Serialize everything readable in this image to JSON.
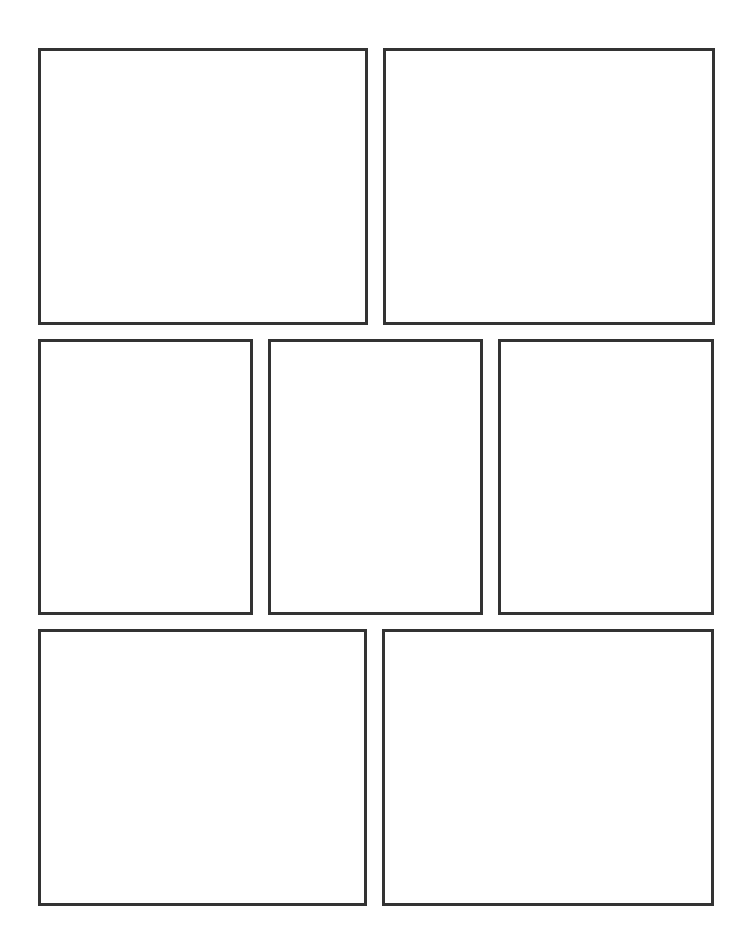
{
  "page": {
    "type": "comic-page-template",
    "background": "#ffffff",
    "border_color": "#333333",
    "rows": [
      {
        "panels": [
          {
            "id": "panel-1",
            "x": 38,
            "y": 48,
            "w": 330,
            "h": 277
          },
          {
            "id": "panel-2",
            "x": 383,
            "y": 48,
            "w": 332,
            "h": 277
          }
        ]
      },
      {
        "panels": [
          {
            "id": "panel-3",
            "x": 38,
            "y": 339,
            "w": 215,
            "h": 276
          },
          {
            "id": "panel-4",
            "x": 268,
            "y": 339,
            "w": 215,
            "h": 276
          },
          {
            "id": "panel-5",
            "x": 498,
            "y": 339,
            "w": 216,
            "h": 276
          }
        ]
      },
      {
        "panels": [
          {
            "id": "panel-6",
            "x": 38,
            "y": 629,
            "w": 329,
            "h": 277
          },
          {
            "id": "panel-7",
            "x": 382,
            "y": 629,
            "w": 332,
            "h": 277
          }
        ]
      }
    ]
  }
}
